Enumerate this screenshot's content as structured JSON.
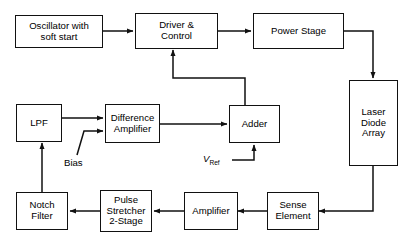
{
  "diagram": {
    "type": "block-diagram",
    "stroke_color": "#111111",
    "background_color": "#ffffff",
    "blocks": [
      {
        "id": "oscillator",
        "label": "Oscillator with\nsoft start",
        "line1": "Oscillator with",
        "line2": "soft start"
      },
      {
        "id": "driver",
        "label": "Driver &\nControl",
        "line1": "Driver &",
        "line2": "Control"
      },
      {
        "id": "power-stage",
        "label": "Power Stage",
        "line1": "Power Stage",
        "line2": ""
      },
      {
        "id": "laser-diode",
        "label": "Laser\nDiode\nArray",
        "line1": "Laser",
        "line2": "Diode",
        "line3": "Array"
      },
      {
        "id": "lpf",
        "label": "LPF",
        "line1": "LPF",
        "line2": ""
      },
      {
        "id": "difference-amplifier",
        "label": "Difference\nAmplifier",
        "line1": "Difference",
        "line2": "Amplifier"
      },
      {
        "id": "adder",
        "label": "Adder",
        "line1": "Adder",
        "line2": ""
      },
      {
        "id": "notch-filter",
        "label": "Notch\nFilter",
        "line1": "Notch",
        "line2": "Filter"
      },
      {
        "id": "pulse-stretcher",
        "label": "Pulse\nStretcher\n2-Stage",
        "line1": "Pulse",
        "line2": "Stretcher",
        "line3": "2-Stage"
      },
      {
        "id": "amplifier",
        "label": "Amplifier",
        "line1": "Amplifier",
        "line2": ""
      },
      {
        "id": "sense-element",
        "label": "Sense\nElement",
        "line1": "Sense",
        "line2": "Element"
      }
    ],
    "signal_labels": {
      "bias": "Bias",
      "vref_symbol": "V",
      "vref_subscript": "Ref"
    },
    "caption": ""
  }
}
